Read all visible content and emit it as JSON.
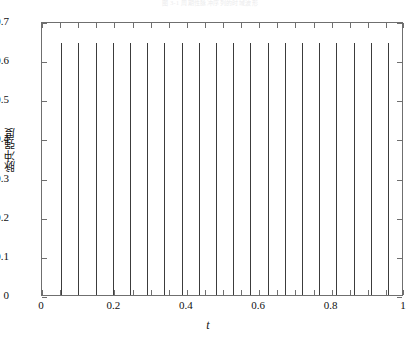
{
  "top_caption": "图 3-1  周期性脉冲序列的时域波形",
  "axes": {
    "y_title": "脉冲强度",
    "x_title": "t",
    "y_ticks": [
      "0",
      "0.1",
      "0.2",
      "0.3",
      "0.4",
      "0.5",
      "0.6",
      "0.7"
    ],
    "x_ticks": [
      "0",
      "0.2",
      "0.4",
      "0.6",
      "0.8",
      "1"
    ],
    "line_color": "#3c3c3c",
    "frame_color": "#6f6f6f"
  },
  "chart_data": {
    "type": "bar",
    "title": "",
    "xlabel": "t",
    "ylabel": "脉冲强度",
    "xlim": [
      0,
      1
    ],
    "ylim": [
      0,
      0.7
    ],
    "xtick_values": [
      0,
      0.2,
      0.4,
      0.6,
      0.8,
      1
    ],
    "ytick_values": [
      0,
      0.1,
      0.2,
      0.3,
      0.4,
      0.5,
      0.6,
      0.7
    ],
    "ytick_labels": [
      "0",
      "0.1",
      "0.2",
      "0.3",
      "0.4",
      "0.5",
      "0.6",
      "0.7"
    ],
    "xtick_labels": [
      "0",
      "0.2",
      "0.4",
      "0.6",
      "0.8",
      "1"
    ],
    "grid": false,
    "legend": null,
    "series": [
      {
        "name": "pulse train",
        "description": "periodic impulse train, constant amplitude",
        "amplitude": 0.645,
        "period": 0.0475,
        "x": [
          0.053,
          0.1005,
          0.148,
          0.1955,
          0.243,
          0.2905,
          0.338,
          0.3855,
          0.433,
          0.4805,
          0.528,
          0.5755,
          0.623,
          0.6705,
          0.718,
          0.7655,
          0.813,
          0.8605,
          0.908,
          0.9555,
          0.998
        ],
        "values": [
          0.645,
          0.645,
          0.645,
          0.645,
          0.645,
          0.645,
          0.645,
          0.645,
          0.645,
          0.645,
          0.645,
          0.645,
          0.645,
          0.645,
          0.645,
          0.645,
          0.645,
          0.645,
          0.645,
          0.645,
          0.645
        ]
      }
    ]
  }
}
